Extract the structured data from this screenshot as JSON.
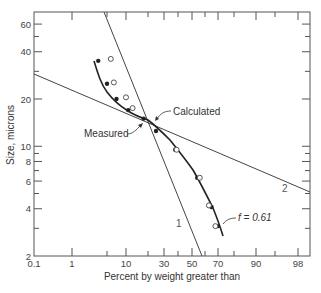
{
  "chart_data": {
    "type": "line",
    "title": "",
    "xlabel": "Percent by weight greater than",
    "ylabel": "Size, microns",
    "x_scale": "probability",
    "y_scale": "log",
    "xlim": [
      0.1,
      99.2
    ],
    "ylim": [
      2,
      70
    ],
    "grid": false,
    "x_ticks": [
      {
        "value": 0.1,
        "label": "0.1",
        "px": 34
      },
      {
        "value": 1,
        "label": "1",
        "px": 72
      },
      {
        "value": 5,
        "label": "",
        "px": 107
      },
      {
        "value": 10,
        "label": "10",
        "px": 126
      },
      {
        "value": 20,
        "label": "",
        "px": 148
      },
      {
        "value": 30,
        "label": "30",
        "px": 164
      },
      {
        "value": 40,
        "label": "",
        "px": 178
      },
      {
        "value": 50,
        "label": "50",
        "px": 192
      },
      {
        "value": 60,
        "label": "",
        "px": 205
      },
      {
        "value": 70,
        "label": "70",
        "px": 218
      },
      {
        "value": 80,
        "label": "",
        "px": 234
      },
      {
        "value": 90,
        "label": "90",
        "px": 256
      },
      {
        "value": 95,
        "label": "",
        "px": 275
      },
      {
        "value": 98,
        "label": "98",
        "px": 298
      }
    ],
    "y_ticks": [
      {
        "value": 60,
        "label": "60"
      },
      {
        "value": 50,
        "label": ""
      },
      {
        "value": 40,
        "label": "40"
      },
      {
        "value": 30,
        "label": ""
      },
      {
        "value": 20,
        "label": "20"
      },
      {
        "value": 10,
        "label": "10"
      },
      {
        "value": 9,
        "label": ""
      },
      {
        "value": 8,
        "label": "8"
      },
      {
        "value": 7,
        "label": ""
      },
      {
        "value": 6,
        "label": "6"
      },
      {
        "value": 5,
        "label": ""
      },
      {
        "value": 4,
        "label": "4"
      },
      {
        "value": 3,
        "label": ""
      },
      {
        "value": 2,
        "label": "2"
      }
    ],
    "series": [
      {
        "name": "Measured",
        "marker": "filled-circle",
        "line": "smooth-curve",
        "points": [
          {
            "x": 4,
            "y": 35
          },
          {
            "x": 5,
            "y": 25
          },
          {
            "x": 7.5,
            "y": 20
          },
          {
            "x": 11,
            "y": 17
          },
          {
            "x": 18,
            "y": 15
          },
          {
            "x": 25,
            "y": 12.5
          },
          {
            "x": 38,
            "y": 9.5
          },
          {
            "x": 54,
            "y": 6.3
          },
          {
            "x": 65,
            "y": 4.1
          },
          {
            "x": 70,
            "y": 3.1
          }
        ]
      },
      {
        "name": "Calculated",
        "marker": "open-circle",
        "points": [
          {
            "x": 6,
            "y": 36
          },
          {
            "x": 6.8,
            "y": 25.5
          },
          {
            "x": 10,
            "y": 20.5
          },
          {
            "x": 13,
            "y": 17.5
          },
          {
            "x": 39,
            "y": 9.5
          },
          {
            "x": 56,
            "y": 6.3
          },
          {
            "x": 63,
            "y": 4.2
          },
          {
            "x": 68,
            "y": 3.1
          }
        ]
      },
      {
        "name": "1",
        "type": "straight-line",
        "endpoints": [
          {
            "px": [
              104,
              12
            ]
          },
          {
            "px": [
              202,
              256
            ]
          }
        ]
      },
      {
        "name": "2",
        "type": "straight-line",
        "endpoints": [
          {
            "px": [
              34,
              74
            ]
          },
          {
            "px": [
              310,
              192
            ]
          }
        ]
      }
    ],
    "annotations": [
      {
        "text": "Calculated",
        "near": {
          "x": 20,
          "y": 15
        }
      },
      {
        "text": "Measured",
        "near": {
          "x": 20,
          "y": 14
        }
      },
      {
        "text": "f = 0.61",
        "near": {
          "x": 68,
          "y": 3.8
        }
      },
      {
        "text": "1",
        "near": {
          "x": 50,
          "y": 3
        }
      },
      {
        "text": "2",
        "near": {
          "x": 95,
          "y": 5.2
        }
      }
    ]
  },
  "labels": {
    "xlabel": "Percent by weight greater than",
    "ylabel": "Size, microns",
    "calculated": "Calculated",
    "measured": "Measured",
    "f_label": "f = 0.61",
    "line1": "1",
    "line2": "2"
  }
}
